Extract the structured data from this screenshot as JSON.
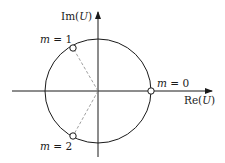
{
  "diagram": {
    "axes": {
      "x_label_prefix": "Re(",
      "x_label_var": "U",
      "x_label_suffix": ")",
      "y_label_prefix": "Im(",
      "y_label_var": "U",
      "y_label_suffix": ")"
    },
    "points": [
      {
        "var": "m",
        "eq": " = ",
        "value": "0"
      },
      {
        "var": "m",
        "eq": " = ",
        "value": "1"
      },
      {
        "var": "m",
        "eq": " = ",
        "value": "2"
      }
    ],
    "colors": {
      "stroke": "#1a1a1a",
      "dashed": "#888888",
      "marker_fill": "#ffffff"
    }
  }
}
